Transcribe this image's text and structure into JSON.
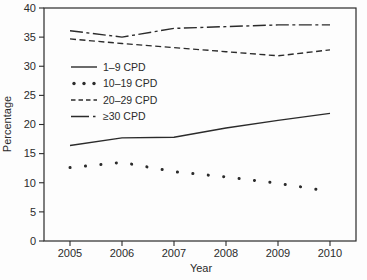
{
  "figure": {
    "background_color": "#fdfdfd",
    "line_color": "#2b2b2b"
  },
  "chart_data": {
    "type": "line",
    "title": "",
    "xlabel": "Year",
    "ylabel": "Percentage",
    "x": [
      2005,
      2006,
      2007,
      2008,
      2009,
      2010
    ],
    "ylim": [
      0,
      40
    ],
    "ytick_step": 5,
    "grid": false,
    "legend_position": "upper-left-inside",
    "series": [
      {
        "name": "1–9 CPD",
        "style": "solid",
        "values": [
          16.4,
          17.7,
          17.8,
          19.4,
          20.7,
          21.9
        ]
      },
      {
        "name": "10–19 CPD",
        "style": "dotted",
        "values": [
          12.6,
          13.5,
          11.9,
          11.0,
          9.9,
          8.5
        ]
      },
      {
        "name": "20–29 CPD",
        "style": "dashed",
        "values": [
          34.7,
          33.9,
          33.2,
          32.5,
          31.8,
          32.8
        ]
      },
      {
        "name": "≥30 CPD",
        "style": "dashdot",
        "values": [
          36.1,
          35.0,
          36.5,
          36.8,
          37.1,
          37.1
        ]
      }
    ]
  }
}
